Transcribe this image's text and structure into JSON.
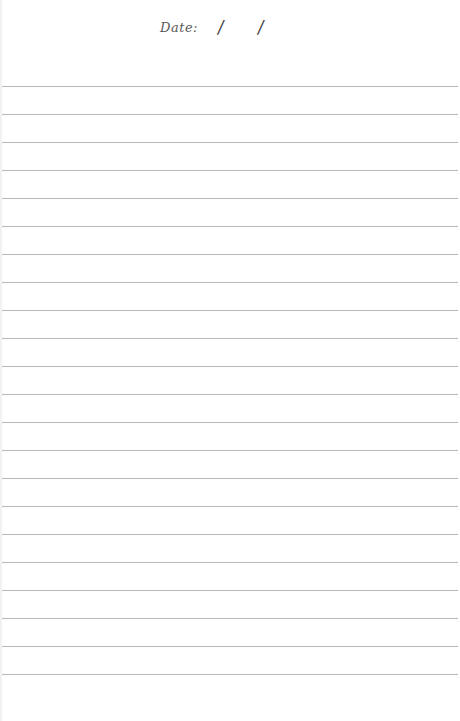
{
  "page": {
    "type": "lined notebook paper",
    "background_color": "#ffffff",
    "rule_color": "#b9b9b9"
  },
  "header": {
    "date_label": "Date:",
    "date_separator_1": "/",
    "date_separator_2": "/"
  },
  "rules": {
    "count": 22,
    "first_y": 86,
    "spacing": 28
  }
}
